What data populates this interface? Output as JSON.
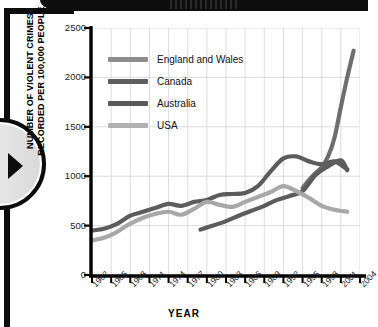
{
  "page": {
    "decorations": {
      "top_band": "black-header-band",
      "left_frame": "black-page-frame",
      "page_badge": "circular-next-arrow-badge"
    }
  },
  "chart_data": {
    "type": "line",
    "title": "",
    "xlabel": "YEAR",
    "ylabel": "NUMBER OF VIOLENT CRIMES\nRECORDED PER 100,000 PEOPLE",
    "xlim": [
      1962,
      2004
    ],
    "ylim": [
      0,
      2500
    ],
    "yticks": [
      0,
      500,
      1000,
      1500,
      2000,
      2500
    ],
    "ytick_labels": [
      "0",
      "500",
      "1000",
      "1500",
      "2000",
      "2500"
    ],
    "xticks": [
      1962,
      1965,
      1968,
      1971,
      1974,
      1977,
      1980,
      1983,
      1986,
      1989,
      1992,
      1995,
      1998,
      2001,
      2004
    ],
    "xtick_labels": [
      "1962",
      "1965",
      "1968",
      "1971",
      "1974",
      "1977",
      "1980",
      "1983",
      "1986",
      "1989",
      "1992",
      "1995",
      "1998",
      "2001",
      "2004"
    ],
    "grid": true,
    "grid_color": "#d7d9dd",
    "legend_position": "upper-left",
    "series": [
      {
        "name": "England and Wales",
        "color": "#6e6e6e",
        "x": [
          1995,
          1996,
          1997,
          1998,
          1999,
          2000,
          2001,
          2002,
          2003
        ],
        "values": [
          880,
          960,
          1030,
          1090,
          1200,
          1390,
          1700,
          2000,
          2270
        ]
      },
      {
        "name": "Canada",
        "color": "#5c5c5c",
        "x": [
          1962,
          1964,
          1966,
          1968,
          1970,
          1972,
          1974,
          1976,
          1978,
          1980,
          1982,
          1984,
          1986,
          1988,
          1990,
          1992,
          1994,
          1996,
          1998,
          2000,
          2002
        ],
        "values": [
          450,
          470,
          520,
          600,
          640,
          680,
          720,
          700,
          740,
          760,
          810,
          820,
          830,
          900,
          1050,
          1180,
          1200,
          1150,
          1120,
          1150,
          1070
        ]
      },
      {
        "name": "Australia",
        "color": "#5c5c5c",
        "x": [
          1979,
          1981,
          1983,
          1985,
          1987,
          1989,
          1991,
          1993,
          1995,
          1997,
          1999,
          2001,
          2002
        ],
        "values": [
          460,
          500,
          545,
          600,
          650,
          700,
          760,
          800,
          850,
          1010,
          1100,
          1160,
          1060
        ]
      },
      {
        "name": "USA",
        "color": "#a8a8a8",
        "x": [
          1962,
          1964,
          1966,
          1968,
          1970,
          1972,
          1974,
          1976,
          1978,
          1980,
          1982,
          1984,
          1986,
          1988,
          1990,
          1992,
          1994,
          1996,
          1998,
          2000,
          2002
        ],
        "values": [
          350,
          380,
          440,
          520,
          580,
          620,
          640,
          610,
          670,
          740,
          710,
          690,
          740,
          790,
          840,
          900,
          850,
          780,
          700,
          660,
          640
        ]
      }
    ]
  },
  "legend": {
    "items": [
      {
        "label": "England and Wales",
        "color": "#8c8c8c"
      },
      {
        "label": "Canada",
        "color": "#5e5e5e"
      },
      {
        "label": "Australia",
        "color": "#5a5a5a"
      },
      {
        "label": "USA",
        "color": "#b0b0b0"
      }
    ]
  },
  "axes": {
    "y_title": "NUMBER OF VIOLENT CRIMES\nRECORDED PER 100,000 PEOPLE",
    "x_title": "YEAR"
  }
}
